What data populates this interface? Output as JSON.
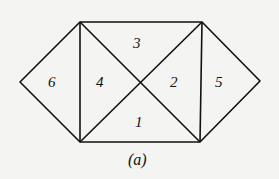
{
  "diagram": {
    "caption": "(a)",
    "regions": [
      {
        "id": "1",
        "label": "1",
        "x": 135,
        "y": 127
      },
      {
        "id": "2",
        "label": "2",
        "x": 174,
        "y": 87
      },
      {
        "id": "3",
        "label": "3",
        "x": 137,
        "y": 48
      },
      {
        "id": "4",
        "label": "4",
        "x": 100,
        "y": 87
      },
      {
        "id": "5",
        "label": "5",
        "x": 219,
        "y": 87
      },
      {
        "id": "6",
        "label": "6",
        "x": 52,
        "y": 87
      }
    ],
    "line_color": "#111111",
    "background": "#f4f4f2"
  }
}
